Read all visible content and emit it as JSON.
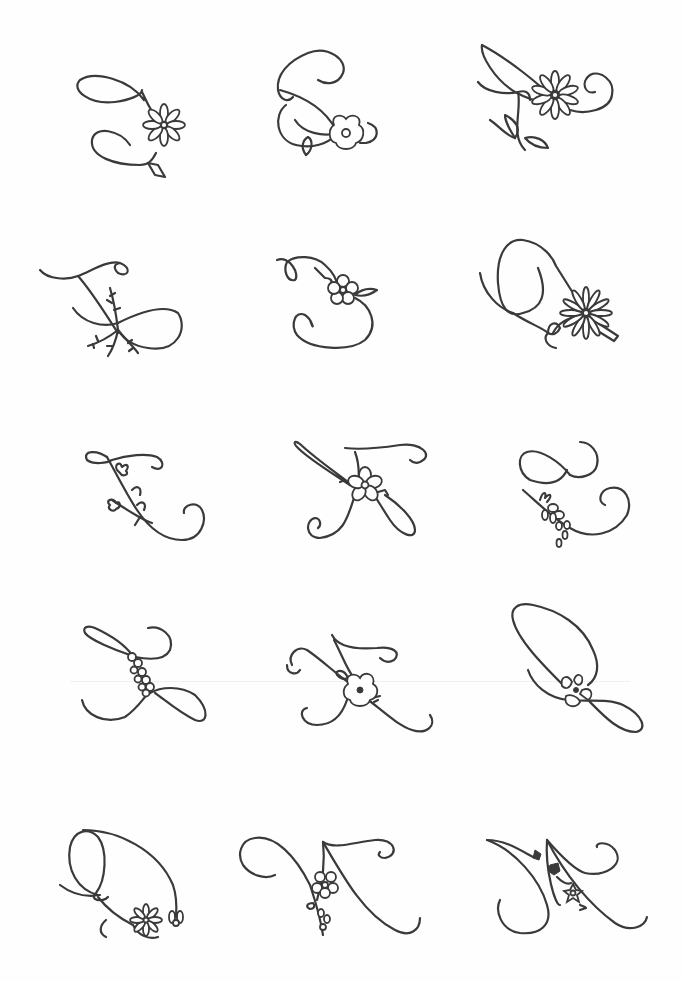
{
  "page": {
    "background": "#fefefe",
    "ink_color": "#3a3a3a",
    "layout": {
      "rows": 5,
      "columns": 3
    }
  },
  "monograms": [
    {
      "letter": "A",
      "ornament": "daisy"
    },
    {
      "letter": "B",
      "ornament": "wild rose"
    },
    {
      "letter": "C",
      "ornament": "daisy with leaves"
    },
    {
      "letter": "D",
      "ornament": "fern sprigs"
    },
    {
      "letter": "E",
      "ornament": "five-petal flower with leaves"
    },
    {
      "letter": "F",
      "ornament": "daisy"
    },
    {
      "letter": "G",
      "ornament": "bud sprig"
    },
    {
      "letter": "H",
      "ornament": "five-petal flower"
    },
    {
      "letter": "I",
      "ornament": "berry sprig"
    },
    {
      "letter": "J",
      "ornament": "small flower cluster"
    },
    {
      "letter": "K",
      "ornament": "wild rose"
    },
    {
      "letter": "L",
      "ornament": "pansy"
    },
    {
      "letter": "M",
      "ornament": "daisy and bud"
    },
    {
      "letter": "N",
      "ornament": "flower with buds"
    },
    {
      "letter": "O",
      "ornament": "star flowers"
    }
  ]
}
